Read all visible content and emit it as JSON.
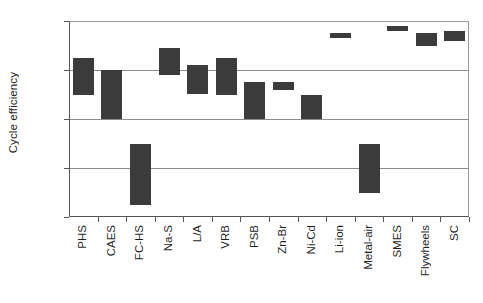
{
  "chart_data": {
    "type": "bar",
    "bar_style": "floating-range",
    "title": "",
    "xlabel": "",
    "ylabel": "Cycle efficiency",
    "ylim": [
      20,
      100
    ],
    "yticks": [
      20,
      40,
      60,
      80,
      100
    ],
    "ytick_labels": [
      "20%",
      "40%",
      "60%",
      "80%",
      "100%"
    ],
    "grid": true,
    "grid_axis": "y",
    "legend": false,
    "value_unit": "%",
    "bar_color": "#3b3b3b",
    "categories": [
      "PHS",
      "CAES",
      "FC-HS",
      "Na-S",
      "L/A",
      "VRB",
      "PSB",
      "Zn-Br",
      "Ni-Cd",
      "Li-ion",
      "Metal-air",
      "SMES",
      "Flywheels",
      "SC"
    ],
    "low": [
      70,
      60,
      25,
      78,
      70,
      70,
      60,
      72,
      60,
      93,
      30,
      96,
      90,
      92
    ],
    "high": [
      85,
      80,
      50,
      89,
      82,
      85,
      75,
      75,
      70,
      95,
      50,
      98,
      95,
      96
    ],
    "points": [
      {
        "category": "PHS",
        "low": 70,
        "high": 85
      },
      {
        "category": "CAES",
        "low": 60,
        "high": 80
      },
      {
        "category": "FC-HS",
        "low": 25,
        "high": 50
      },
      {
        "category": "Na-S",
        "low": 78,
        "high": 89
      },
      {
        "category": "L/A",
        "low": 70,
        "high": 82
      },
      {
        "category": "VRB",
        "low": 70,
        "high": 85
      },
      {
        "category": "PSB",
        "low": 60,
        "high": 75
      },
      {
        "category": "Zn-Br",
        "low": 72,
        "high": 75
      },
      {
        "category": "Ni-Cd",
        "low": 60,
        "high": 70
      },
      {
        "category": "Li-ion",
        "low": 93,
        "high": 95
      },
      {
        "category": "Metal-air",
        "low": 30,
        "high": 50
      },
      {
        "category": "SMES",
        "low": 96,
        "high": 98
      },
      {
        "category": "Flywheels",
        "low": 90,
        "high": 95
      },
      {
        "category": "SC",
        "low": 92,
        "high": 96
      }
    ]
  }
}
